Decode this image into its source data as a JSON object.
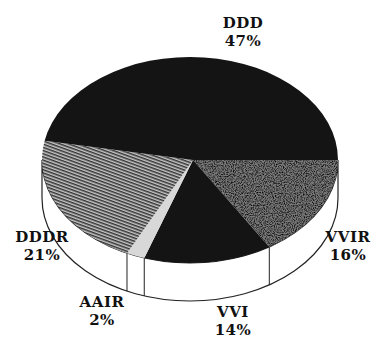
{
  "chart_data": {
    "type": "pie",
    "style": "3d",
    "title": "",
    "slices": [
      {
        "label": "DDD",
        "value": 47,
        "display": "47%",
        "fill": "solid-black"
      },
      {
        "label": "VVIR",
        "value": 16,
        "display": "16%",
        "fill": "stipple-gray"
      },
      {
        "label": "VVI",
        "value": 14,
        "display": "14%",
        "fill": "solid-black"
      },
      {
        "label": "AAIR",
        "value": 2,
        "display": "2%",
        "fill": "light-gray"
      },
      {
        "label": "DDDR",
        "value": 21,
        "display": "21%",
        "fill": "hatched-gray"
      }
    ],
    "legend": "none",
    "labels_position": "outside"
  },
  "labels": {
    "ddd": {
      "name": "DDD",
      "pct": "47%"
    },
    "vvir": {
      "name": "VVIR",
      "pct": "16%"
    },
    "vvi": {
      "name": "VVI",
      "pct": "14%"
    },
    "aair": {
      "name": "AAIR",
      "pct": "2%"
    },
    "dddr": {
      "name": "DDDR",
      "pct": "21%"
    }
  },
  "colors": {
    "black": "#141414",
    "stipple": "#7a7a7a",
    "hatch": "#8a8a8a",
    "light": "#d8d8d8",
    "edge": "#222222"
  }
}
